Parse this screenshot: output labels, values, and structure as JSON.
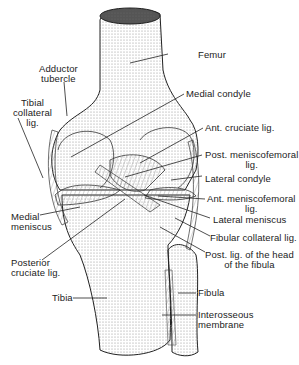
{
  "figure": {
    "labels": {
      "femur": "Femur",
      "adductor_tubercle": [
        "Adductor",
        "tubercle"
      ],
      "tibial_collateral_lig": [
        "Tibial",
        "collateral",
        "lig."
      ],
      "medial_condyle": "Medial  condyle",
      "ant_cruciate_lig": "Ant. cruciate lig.",
      "post_meniscofemoral_lig": [
        "Post. meniscofemoral",
        "lig."
      ],
      "lateral_condyle": "Lateral  condyle",
      "ant_meniscofemoral_lig": [
        "Ant. meniscofemoral",
        "lig."
      ],
      "lateral_meniscus": "Lateral  meniscus",
      "medial_meniscus": [
        "Medial",
        "meniscus"
      ],
      "fibular_collateral_lig": "Fibular collateral lig.",
      "post_lig_head_fibula": [
        "Post. lig. of the head",
        "of the fibula"
      ],
      "posterior_cruciate_lig": [
        "Posterior",
        "cruciate  lig."
      ],
      "tibia": "Tibia",
      "fibula": "Fibula",
      "interosseous_membrane": [
        "Interosseous",
        "membrane"
      ]
    },
    "colors": {
      "line": "#222222",
      "stipple": "#9a9a9a",
      "background": "#ffffff"
    }
  }
}
